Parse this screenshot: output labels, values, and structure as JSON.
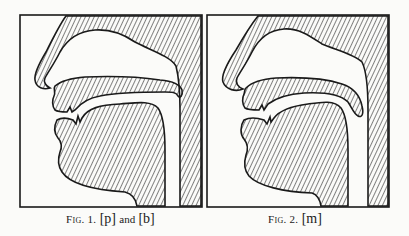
{
  "figures": [
    {
      "id": "fig1",
      "label": "Fig. 1.",
      "symbol_1": "[p]",
      "conjunction": "and",
      "symbol_2": "[b]",
      "description": "Sagittal section of vocal tract with lips closed and velum raised"
    },
    {
      "id": "fig2",
      "label": "Fig. 2.",
      "symbol_1": "[m]",
      "description": "Sagittal section of vocal tract with lips closed and velum lowered"
    }
  ],
  "colors": {
    "ink": "#1a1a1a",
    "paper": "#fbfbf9"
  }
}
